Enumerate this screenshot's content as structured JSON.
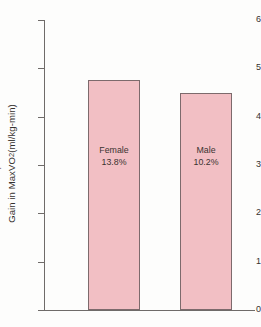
{
  "chart_data": {
    "type": "bar",
    "title": "",
    "xlabel": "",
    "ylabel": "Gain in Max V̇O₂ (ml/kg-min)",
    "ylabel_parts": {
      "prefix": "Gain in Max ",
      "v": "V",
      "o": "O",
      "sub": "2",
      "suffix": " (ml/kg-min)"
    },
    "categories": [
      "Female",
      "Male"
    ],
    "values": [
      4.75,
      4.5
    ],
    "point_labels": [
      "13.8%",
      "10.2%"
    ],
    "ylim": [
      0,
      6
    ],
    "yticks": [
      0,
      1,
      2,
      3,
      4,
      5,
      6
    ],
    "ytick_labels": [
      "0",
      "1",
      "2",
      "3",
      "4",
      "5",
      "6"
    ],
    "grid": false,
    "legend": null,
    "bar_fill_color": "#f2bfc4",
    "bar_border_color": "#7d6a6c",
    "axis_color": "#6f6b69",
    "background_color": "#fdfdfc",
    "text_color": "#35312f"
  }
}
